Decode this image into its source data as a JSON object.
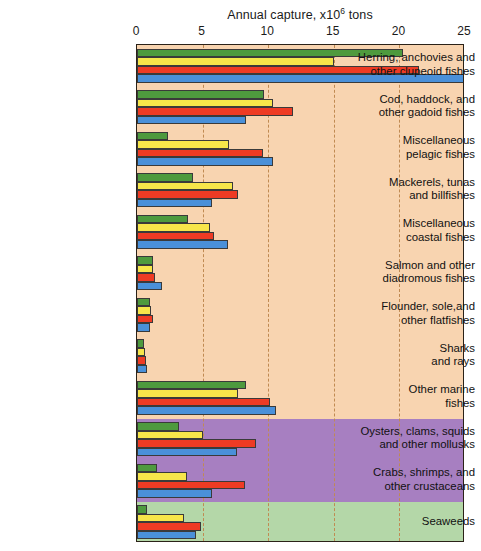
{
  "chart": {
    "title_main": "Annual capture, x10",
    "title_sup": "6",
    "title_tail": " tons"
  },
  "axis": {
    "ticks": [
      "0",
      "5",
      "10",
      "15",
      "20",
      "25"
    ]
  },
  "chart_data": {
    "type": "bar",
    "orientation": "horizontal",
    "xlabel": "Annual capture, x10^6 tons",
    "ylabel": "",
    "xlim": [
      0,
      25
    ],
    "xticks": [
      0,
      5,
      10,
      15,
      20,
      25
    ],
    "grid": "vertical dashed gridlines at x = 5, 10, 15, 20",
    "legend": "none",
    "categories": [
      "Herring, anchovies and other clupeoid fishes",
      "Cod, haddock, and other gadoid fishes",
      "Miscellaneous pelagic fishes",
      "Mackerels, tunas and billfishes",
      "Miscellaneous coastal fishes",
      "Salmon and other diadromous fishes",
      "Flounder, sole,and other flatfishes",
      "Sharks and rays",
      "Other marine fishes",
      "Oysters, clams, squids and other mollusks",
      "Crabs, shrimps, and other crustaceans",
      "Seaweeds"
    ],
    "series": [
      {
        "name": "series-1",
        "color": "#4e9a3e",
        "values": [
          20.3,
          9.7,
          2.4,
          4.3,
          3.9,
          1.2,
          1.0,
          0.5,
          8.3,
          3.2,
          1.5,
          0.8
        ]
      },
      {
        "name": "series-2",
        "color": "#f7e64a",
        "values": [
          15.0,
          10.4,
          7.0,
          7.3,
          5.6,
          1.2,
          1.1,
          0.6,
          7.7,
          5.0,
          3.8,
          3.6
        ]
      },
      {
        "name": "series-3",
        "color": "#ee3b24",
        "values": [
          21.5,
          11.9,
          9.6,
          7.7,
          5.9,
          1.4,
          1.2,
          0.7,
          10.1,
          9.1,
          8.2,
          4.9
        ]
      },
      {
        "name": "series-4",
        "color": "#4a90d9",
        "values": [
          25.0,
          8.3,
          10.4,
          5.7,
          6.9,
          1.9,
          1.0,
          0.8,
          10.6,
          7.6,
          5.7,
          4.5
        ]
      }
    ],
    "background_bands": [
      {
        "name": "fish-band",
        "color": "#f8d4b0",
        "from_category": 0,
        "to_category": 8
      },
      {
        "name": "invertebrate-band",
        "color": "#a77fc1",
        "from_category": 9,
        "to_category": 10
      },
      {
        "name": "plant-band",
        "color": "#b4d7a8",
        "from_category": 11,
        "to_category": 11
      }
    ]
  },
  "colors": {
    "plot_border": "#2b2218",
    "gridline": "#c08a52",
    "band_fish": "#f8d4b0",
    "band_mollusk": "#a77fc1",
    "band_seaweed": "#b4d7a8"
  }
}
